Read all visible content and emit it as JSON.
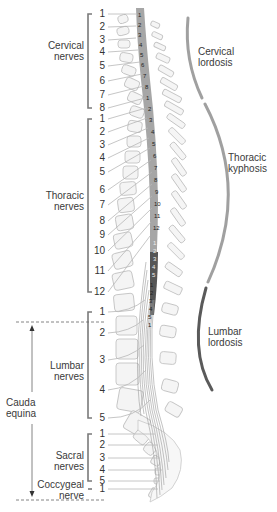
{
  "groups": {
    "cervical": {
      "label_line1": "Cervical",
      "label_line2": "nerves",
      "numbers": [
        "1",
        "2",
        "3",
        "4",
        "5",
        "6",
        "7",
        "8"
      ],
      "y": [
        14,
        27,
        40,
        52,
        66,
        81,
        95,
        108
      ]
    },
    "thoracic": {
      "label_line1": "Thoracic",
      "label_line2": "nerves",
      "numbers": [
        "1",
        "2",
        "3",
        "4",
        "5",
        "6",
        "7",
        "8",
        "9",
        "10",
        "11",
        "12"
      ],
      "y": [
        119,
        132,
        145,
        158,
        172,
        190,
        205,
        221,
        235,
        251,
        271,
        292
      ]
    },
    "lumbar": {
      "label_line1": "Lumbar",
      "label_line2": "nerves",
      "numbers": [
        "1",
        "2",
        "3",
        "4",
        "5"
      ],
      "y": [
        312,
        333,
        360,
        390,
        418
      ]
    },
    "sacral": {
      "label_line1": "Sacral",
      "label_line2": "nerves",
      "numbers": [
        "1",
        "2",
        "3",
        "4",
        "5"
      ],
      "y": [
        434,
        445,
        458,
        470,
        481
      ]
    },
    "coccygeal": {
      "label_line1": "Coccygeal",
      "label_line2": "nerve",
      "numbers": [
        "1"
      ],
      "y": [
        489
      ]
    }
  },
  "cauda_equina": {
    "label_line1": "Cauda",
    "label_line2": "equina"
  },
  "curvatures": {
    "cervical": {
      "label_line1": "Cervical",
      "label_line2": "lordosis",
      "color": "#9a9a9a"
    },
    "thoracic": {
      "label_line1": "Thoracic",
      "label_line2": "kyphosis",
      "color": "#9a9a9a"
    },
    "lumbar": {
      "label_line1": "Lumbar",
      "label_line2": "lordosis",
      "color": "#555555"
    }
  },
  "cord_segments": {
    "cervical": [
      "1",
      "2",
      "3",
      "4",
      "5",
      "6",
      "7",
      "8"
    ],
    "thoracic": [
      "1",
      "2",
      "3",
      "4",
      "5",
      "6",
      "7",
      "8",
      "9",
      "10",
      "11",
      "12"
    ],
    "lumbar": [
      "1",
      "2",
      "3",
      "4",
      "5"
    ],
    "sacral": [
      "1",
      "2",
      "3",
      "4",
      "5",
      "1"
    ]
  },
  "colors": {
    "cord_cervical_thoracic": "#9e9e9e",
    "cord_lumbar": "#555555",
    "bracket": "#777777",
    "nerve_line": "#b5b5b5",
    "vertebra_fill": "#f4f4f4",
    "vertebra_stroke": "#bdbdbd"
  }
}
